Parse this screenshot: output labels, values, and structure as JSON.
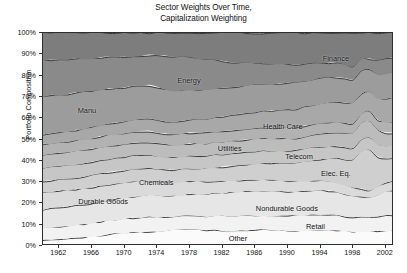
{
  "chart_data": {
    "type": "area",
    "title": "Sector Weights Over Time, Capitalization Weighting",
    "title_line1": "Sector Weights Over Time,",
    "title_line2": "Capitalization Weighting",
    "xlabel": "",
    "ylabel": "Portfolio Composition",
    "stacked": true,
    "normalized_percent": true,
    "grid": false,
    "legend_position": "in-plot-labels",
    "xlim": [
      1960,
      2003
    ],
    "ylim": [
      0,
      100
    ],
    "x_tick_labels": [
      "1962",
      "1966",
      "1970",
      "1974",
      "1978",
      "1982",
      "1986",
      "1990",
      "1994",
      "1998",
      "2002"
    ],
    "x_ticks": [
      1962,
      1966,
      1970,
      1974,
      1978,
      1982,
      1986,
      1990,
      1994,
      1998,
      2002
    ],
    "y_tick_labels": [
      "0%",
      "10%",
      "20%",
      "30%",
      "40%",
      "50%",
      "60%",
      "70%",
      "80%",
      "90%",
      "100%"
    ],
    "y_ticks": [
      0,
      10,
      20,
      30,
      40,
      50,
      60,
      70,
      80,
      90,
      100
    ],
    "x": [
      1960,
      1961,
      1962,
      1963,
      1964,
      1965,
      1966,
      1967,
      1968,
      1969,
      1970,
      1971,
      1972,
      1973,
      1974,
      1975,
      1976,
      1977,
      1978,
      1979,
      1980,
      1981,
      1982,
      1983,
      1984,
      1985,
      1986,
      1987,
      1988,
      1989,
      1990,
      1991,
      1992,
      1993,
      1994,
      1995,
      1996,
      1997,
      1998,
      1999,
      2000,
      2001,
      2002,
      2003
    ],
    "series": [
      {
        "name": "Other",
        "stack_order": 1,
        "color": "#fbfbfb",
        "values": [
          3.0,
          3.2,
          3.4,
          3.6,
          3.9,
          4.2,
          4.6,
          5.0,
          5.4,
          5.7,
          6.0,
          6.2,
          6.4,
          6.6,
          6.9,
          7.3,
          7.7,
          8.0,
          8.0,
          7.8,
          7.6,
          7.5,
          7.4,
          7.4,
          7.5,
          7.6,
          7.7,
          7.7,
          7.6,
          7.5,
          7.4,
          7.4,
          7.5,
          7.6,
          7.7,
          7.7,
          7.6,
          7.4,
          7.2,
          7.0,
          6.9,
          7.0,
          7.2,
          7.3
        ]
      },
      {
        "name": "Retail",
        "stack_order": 2,
        "color": "#f2f2f2",
        "values": [
          5.6,
          5.7,
          5.8,
          5.9,
          6.0,
          6.1,
          6.2,
          6.4,
          6.6,
          6.8,
          6.9,
          7.0,
          7.1,
          7.0,
          6.8,
          6.7,
          6.6,
          6.6,
          6.7,
          6.8,
          6.9,
          7.0,
          7.1,
          7.2,
          7.2,
          7.2,
          7.1,
          7.0,
          7.0,
          7.1,
          7.2,
          7.3,
          7.4,
          7.5,
          7.5,
          7.4,
          7.3,
          7.2,
          7.1,
          6.6,
          6.4,
          6.8,
          7.1,
          7.2
        ]
      },
      {
        "name": "Nondurable Goods",
        "stack_order": 3,
        "color": "#e6e6e6",
        "values": [
          8.6,
          8.7,
          8.8,
          8.9,
          9.1,
          9.2,
          9.3,
          9.4,
          9.5,
          9.6,
          9.7,
          9.9,
          10.1,
          10.2,
          10.2,
          10.1,
          10.0,
          10.1,
          10.3,
          10.5,
          10.7,
          10.9,
          11.0,
          11.2,
          11.4,
          11.6,
          11.8,
          11.9,
          11.9,
          11.8,
          11.7,
          11.8,
          12.0,
          12.1,
          12.0,
          11.8,
          11.5,
          11.1,
          10.6,
          9.6,
          9.2,
          10.3,
          11.2,
          11.5
        ]
      },
      {
        "name": "Durable Goods",
        "stack_order": 4,
        "color": "#dadada",
        "values": [
          8.0,
          7.9,
          7.8,
          7.7,
          7.6,
          7.5,
          7.4,
          7.3,
          7.2,
          7.1,
          7.0,
          6.9,
          6.8,
          6.7,
          6.6,
          6.5,
          6.5,
          6.4,
          6.3,
          6.2,
          6.1,
          6.0,
          5.9,
          5.8,
          5.7,
          5.6,
          5.5,
          5.4,
          5.3,
          5.2,
          5.1,
          5.0,
          4.9,
          4.8,
          4.7,
          4.6,
          4.5,
          4.3,
          4.1,
          3.6,
          3.4,
          3.8,
          4.1,
          4.2
        ]
      },
      {
        "name": "Elec. Eq.",
        "stack_order": 5,
        "color": "#cfcfcf",
        "values": [
          5.0,
          5.1,
          5.2,
          5.3,
          5.4,
          5.5,
          5.6,
          5.7,
          5.8,
          5.8,
          5.8,
          5.9,
          6.0,
          6.0,
          5.9,
          5.8,
          5.8,
          5.9,
          6.0,
          6.2,
          6.4,
          6.6,
          6.8,
          7.0,
          7.2,
          7.4,
          7.6,
          7.8,
          8.0,
          8.3,
          8.6,
          9.0,
          9.4,
          9.8,
          10.3,
          11.0,
          11.8,
          12.8,
          14.0,
          17.5,
          19.5,
          14.0,
          11.5,
          11.0
        ]
      },
      {
        "name": "Chemicals",
        "stack_order": 6,
        "color": "#c6c6c6",
        "values": [
          6.4,
          6.4,
          6.4,
          6.4,
          6.4,
          6.4,
          6.4,
          6.4,
          6.4,
          6.3,
          6.3,
          6.3,
          6.3,
          6.2,
          6.2,
          6.2,
          6.2,
          6.2,
          6.2,
          6.2,
          6.2,
          6.2,
          6.2,
          6.2,
          6.2,
          6.2,
          6.2,
          6.2,
          6.2,
          6.2,
          6.2,
          6.2,
          6.2,
          6.2,
          6.2,
          6.1,
          6.0,
          5.9,
          5.8,
          5.3,
          5.1,
          5.6,
          6.0,
          6.1
        ]
      },
      {
        "name": "Telecom",
        "stack_order": 7,
        "color": "#bcbcbc",
        "values": [
          6.0,
          6.0,
          6.0,
          6.0,
          6.0,
          6.0,
          6.0,
          6.0,
          5.9,
          5.9,
          5.9,
          5.9,
          5.9,
          5.9,
          5.9,
          5.9,
          5.9,
          5.9,
          5.9,
          5.9,
          5.9,
          5.9,
          5.9,
          5.9,
          5.9,
          5.9,
          5.9,
          5.9,
          5.9,
          5.9,
          5.9,
          5.9,
          5.9,
          6.0,
          6.1,
          6.3,
          6.5,
          6.8,
          7.2,
          8.0,
          8.4,
          6.9,
          6.0,
          5.8
        ]
      },
      {
        "name": "Utilities",
        "stack_order": 8,
        "color": "#b2b2b2",
        "values": [
          5.2,
          5.2,
          5.2,
          5.2,
          5.2,
          5.2,
          5.2,
          5.2,
          5.2,
          5.2,
          5.2,
          5.2,
          5.2,
          5.2,
          5.2,
          5.2,
          5.2,
          5.2,
          5.2,
          5.2,
          5.2,
          5.2,
          5.2,
          5.2,
          5.2,
          5.2,
          5.2,
          5.2,
          5.2,
          5.2,
          5.2,
          5.2,
          5.2,
          5.2,
          5.2,
          5.1,
          5.0,
          4.9,
          4.8,
          4.4,
          4.2,
          4.6,
          5.0,
          5.1
        ]
      },
      {
        "name": "Health Care",
        "stack_order": 9,
        "color": "#a8a8a8",
        "values": [
          4.4,
          4.5,
          4.6,
          4.7,
          4.8,
          4.9,
          5.0,
          5.1,
          5.2,
          5.3,
          5.4,
          5.6,
          5.8,
          5.9,
          6.0,
          6.1,
          6.2,
          6.3,
          6.4,
          6.5,
          6.6,
          6.8,
          7.0,
          7.2,
          7.4,
          7.6,
          7.8,
          8.0,
          8.2,
          8.4,
          8.6,
          8.9,
          9.2,
          9.4,
          9.6,
          9.8,
          10.0,
          10.2,
          10.4,
          9.6,
          9.3,
          10.4,
          11.0,
          11.2
        ]
      },
      {
        "name": "Manu",
        "stack_order": 10,
        "color": "#9c9c9c",
        "values": [
          18.0,
          17.9,
          17.8,
          17.6,
          17.4,
          17.2,
          17.0,
          16.8,
          16.6,
          16.4,
          16.2,
          16.0,
          15.8,
          15.6,
          15.4,
          15.2,
          15.0,
          14.8,
          14.6,
          14.4,
          14.2,
          14.0,
          13.8,
          13.6,
          13.5,
          13.4,
          13.3,
          13.2,
          13.1,
          13.0,
          12.9,
          12.8,
          12.7,
          12.6,
          12.5,
          12.3,
          12.1,
          11.9,
          11.7,
          10.8,
          10.4,
          11.3,
          11.9,
          12.0
        ]
      },
      {
        "name": "Energy",
        "stack_order": 11,
        "color": "#8a8a8a",
        "values": [
          17.0,
          16.8,
          16.6,
          16.3,
          16.0,
          15.7,
          15.4,
          15.1,
          14.8,
          14.5,
          14.2,
          14.0,
          13.8,
          14.2,
          15.2,
          16.0,
          16.4,
          16.2,
          15.6,
          15.2,
          15.0,
          14.2,
          13.2,
          12.4,
          11.8,
          11.2,
          10.6,
          10.2,
          9.8,
          9.4,
          9.2,
          8.8,
          8.4,
          8.0,
          7.6,
          7.3,
          7.1,
          6.8,
          6.4,
          5.4,
          5.0,
          6.2,
          6.8,
          7.0
        ]
      },
      {
        "name": "Finance",
        "stack_order": 12,
        "color": "#7d7d7d",
        "values": [
          12.8,
          12.6,
          12.4,
          12.4,
          12.2,
          12.1,
          11.9,
          11.6,
          11.4,
          11.4,
          11.4,
          11.1,
          10.8,
          10.5,
          10.7,
          11.0,
          11.5,
          11.6,
          11.8,
          12.3,
          12.4,
          12.7,
          13.5,
          14.1,
          14.0,
          14.1,
          14.3,
          14.5,
          14.9,
          15.0,
          15.0,
          15.5,
          15.2,
          14.8,
          14.6,
          14.6,
          14.6,
          15.7,
          16.7,
          12.2,
          12.2,
          13.1,
          12.2,
          11.6
        ]
      }
    ],
    "band_labels": [
      {
        "text": "Finance",
        "x": 1996.0,
        "y": 88.0
      },
      {
        "text": "Energy",
        "x": 1978.0,
        "y": 77.5
      },
      {
        "text": "Manu",
        "x": 1965.5,
        "y": 63.5
      },
      {
        "text": "Health Care",
        "x": 1989.5,
        "y": 56.0
      },
      {
        "text": "Utilities",
        "x": 1983.0,
        "y": 45.5
      },
      {
        "text": "Telecom",
        "x": 1991.5,
        "y": 42.0
      },
      {
        "text": "Chemicals",
        "x": 1974.0,
        "y": 29.5
      },
      {
        "text": "Elec. Eq.",
        "x": 1996.0,
        "y": 34.0
      },
      {
        "text": "Durable Goods",
        "x": 1967.5,
        "y": 20.5
      },
      {
        "text": "Nondurable Goods",
        "x": 1990.0,
        "y": 17.5
      },
      {
        "text": "Retail",
        "x": 1993.5,
        "y": 9.0
      },
      {
        "text": "Other",
        "x": 1984.0,
        "y": 3.5
      }
    ]
  }
}
